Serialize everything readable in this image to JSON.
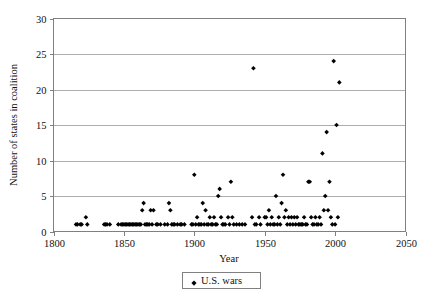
{
  "chart_data": {
    "type": "scatter",
    "title": "",
    "xlabel": "Year",
    "ylabel": "Number of states in coalition",
    "xlim": [
      1800,
      2050
    ],
    "ylim": [
      0,
      30
    ],
    "xticks": [
      1800,
      1850,
      1900,
      1950,
      2000,
      2050
    ],
    "yticks": [
      0,
      5,
      10,
      15,
      20,
      25,
      30
    ],
    "xtick_labels": [
      "1800",
      "1850",
      "1900",
      "1950",
      "2000",
      "2050"
    ],
    "ytick_labels": [
      "0",
      "5",
      "10",
      "15",
      "20",
      "25",
      "30"
    ],
    "grid": "horizontal",
    "legend_position": "bottom-center",
    "marker": "diamond",
    "marker_color": "#000000",
    "series": [
      {
        "name": "U.S. wars",
        "points": [
          [
            1816,
            1
          ],
          [
            1817,
            1
          ],
          [
            1819,
            1
          ],
          [
            1820,
            1
          ],
          [
            1823,
            2
          ],
          [
            1824,
            1
          ],
          [
            1836,
            1
          ],
          [
            1837,
            1
          ],
          [
            1838,
            1
          ],
          [
            1840,
            1
          ],
          [
            1846,
            1
          ],
          [
            1848,
            1
          ],
          [
            1849,
            1
          ],
          [
            1850,
            1
          ],
          [
            1851,
            1
          ],
          [
            1852,
            1
          ],
          [
            1853,
            1
          ],
          [
            1854,
            1
          ],
          [
            1855,
            1
          ],
          [
            1856,
            1
          ],
          [
            1857,
            1
          ],
          [
            1858,
            1
          ],
          [
            1859,
            1
          ],
          [
            1860,
            1
          ],
          [
            1861,
            1
          ],
          [
            1862,
            1
          ],
          [
            1863,
            3
          ],
          [
            1864,
            4
          ],
          [
            1865,
            1
          ],
          [
            1866,
            1
          ],
          [
            1867,
            1
          ],
          [
            1868,
            1
          ],
          [
            1869,
            3
          ],
          [
            1870,
            1
          ],
          [
            1871,
            3
          ],
          [
            1873,
            1
          ],
          [
            1874,
            1
          ],
          [
            1876,
            1
          ],
          [
            1879,
            1
          ],
          [
            1881,
            1
          ],
          [
            1882,
            4
          ],
          [
            1883,
            3
          ],
          [
            1884,
            1
          ],
          [
            1885,
            1
          ],
          [
            1886,
            1
          ],
          [
            1888,
            1
          ],
          [
            1890,
            1
          ],
          [
            1891,
            1
          ],
          [
            1893,
            1
          ],
          [
            1898,
            1
          ],
          [
            1899,
            1
          ],
          [
            1900,
            8
          ],
          [
            1901,
            1
          ],
          [
            1902,
            2
          ],
          [
            1903,
            1
          ],
          [
            1904,
            1
          ],
          [
            1905,
            1
          ],
          [
            1906,
            4
          ],
          [
            1907,
            1
          ],
          [
            1908,
            3
          ],
          [
            1909,
            1
          ],
          [
            1910,
            1
          ],
          [
            1911,
            2
          ],
          [
            1912,
            1
          ],
          [
            1913,
            1
          ],
          [
            1914,
            2
          ],
          [
            1915,
            1
          ],
          [
            1916,
            1
          ],
          [
            1917,
            5
          ],
          [
            1918,
            6
          ],
          [
            1919,
            2
          ],
          [
            1920,
            1
          ],
          [
            1921,
            1
          ],
          [
            1922,
            1
          ],
          [
            1924,
            2
          ],
          [
            1925,
            1
          ],
          [
            1926,
            7
          ],
          [
            1927,
            2
          ],
          [
            1928,
            1
          ],
          [
            1930,
            1
          ],
          [
            1932,
            1
          ],
          [
            1934,
            1
          ],
          [
            1936,
            1
          ],
          [
            1941,
            2
          ],
          [
            1942,
            23
          ],
          [
            1943,
            1
          ],
          [
            1944,
            1
          ],
          [
            1946,
            2
          ],
          [
            1947,
            1
          ],
          [
            1950,
            2
          ],
          [
            1951,
            2
          ],
          [
            1952,
            1
          ],
          [
            1953,
            3
          ],
          [
            1954,
            1
          ],
          [
            1955,
            2
          ],
          [
            1956,
            1
          ],
          [
            1957,
            1
          ],
          [
            1958,
            5
          ],
          [
            1959,
            1
          ],
          [
            1960,
            2
          ],
          [
            1961,
            1
          ],
          [
            1962,
            4
          ],
          [
            1963,
            8
          ],
          [
            1964,
            2
          ],
          [
            1965,
            3
          ],
          [
            1966,
            1
          ],
          [
            1967,
            2
          ],
          [
            1968,
            1
          ],
          [
            1969,
            2
          ],
          [
            1970,
            1
          ],
          [
            1971,
            2
          ],
          [
            1972,
            1
          ],
          [
            1973,
            2
          ],
          [
            1974,
            1
          ],
          [
            1975,
            1
          ],
          [
            1976,
            1
          ],
          [
            1977,
            1
          ],
          [
            1978,
            2
          ],
          [
            1979,
            1
          ],
          [
            1980,
            1
          ],
          [
            1981,
            7
          ],
          [
            1982,
            7
          ],
          [
            1983,
            2
          ],
          [
            1984,
            1
          ],
          [
            1985,
            1
          ],
          [
            1986,
            2
          ],
          [
            1987,
            1
          ],
          [
            1988,
            1
          ],
          [
            1989,
            2
          ],
          [
            1990,
            1
          ],
          [
            1991,
            11
          ],
          [
            1992,
            3
          ],
          [
            1993,
            5
          ],
          [
            1994,
            14
          ],
          [
            1995,
            3
          ],
          [
            1996,
            7
          ],
          [
            1997,
            2
          ],
          [
            1998,
            1
          ],
          [
            1999,
            24
          ],
          [
            2000,
            1
          ],
          [
            2001,
            15
          ],
          [
            2002,
            2
          ],
          [
            2003,
            21
          ]
        ]
      }
    ]
  },
  "legend": {
    "entries": [
      {
        "label": "U.S. wars",
        "marker": "diamond",
        "color": "#000000"
      }
    ]
  },
  "caption": {
    "text": ""
  }
}
